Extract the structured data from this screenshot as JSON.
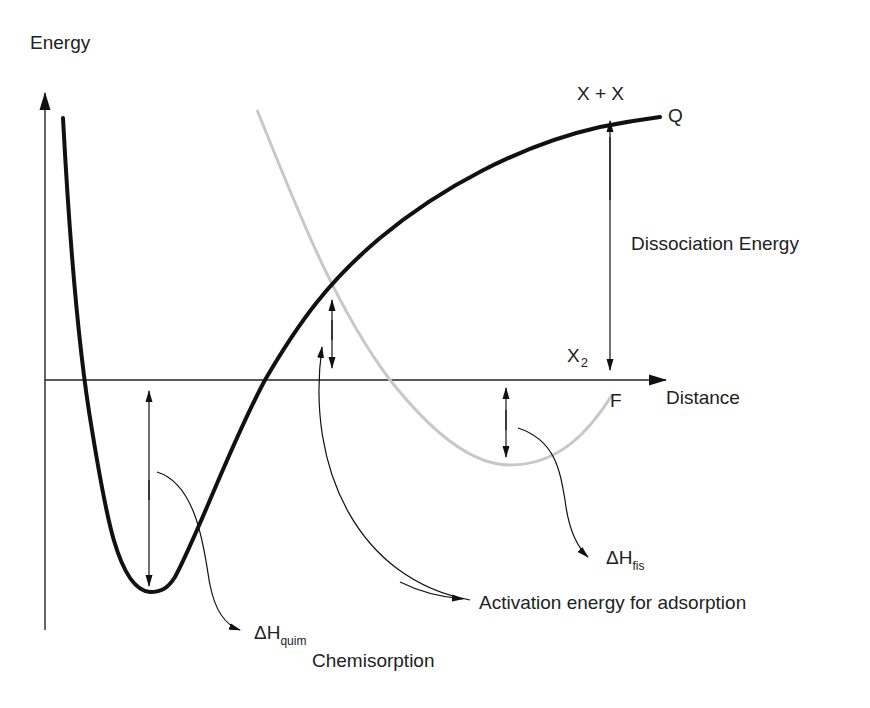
{
  "diagram": {
    "axes": {
      "y_label": "Energy",
      "x_label": "Distance"
    },
    "curves": [
      {
        "name": "Q",
        "label": "Q",
        "description": "Chemisorption potential curve",
        "color": "#111111",
        "style": "solid-thick"
      },
      {
        "name": "F",
        "label": "F",
        "description": "Physisorption potential curve",
        "color": "#c8c8c8",
        "style": "solid-light"
      }
    ],
    "labels": {
      "dissociated_state": "X + X",
      "molecule_state_main": "X",
      "molecule_state_sub": "2",
      "curve_q": "Q",
      "curve_f": "F",
      "dissociation_energy": "Dissociation Energy",
      "activation_energy": "Activation energy for adsorption",
      "dh_fis_main": "ΔH",
      "dh_fis_sub": "fis",
      "dh_quim_main": "ΔH",
      "dh_quim_sub": "quim",
      "chemisorption": "Chemisorption"
    },
    "colors": {
      "ink": "#111111",
      "physisorption_curve": "#c8c8c8",
      "background": "#ffffff"
    }
  }
}
